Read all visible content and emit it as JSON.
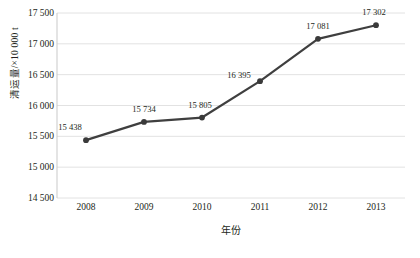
{
  "chart_data": {
    "type": "line",
    "title": "",
    "xlabel": "年份",
    "ylabel": "清运量/×10 000 t",
    "categories": [
      "2008",
      "2009",
      "2010",
      "2011",
      "2012",
      "2013"
    ],
    "values": [
      15438,
      15734,
      15805,
      16395,
      17081,
      17302
    ],
    "point_labels": [
      "15 438",
      "15 734",
      "15 805",
      "16 395",
      "17 081",
      "17 302"
    ],
    "ylim": [
      14500,
      17500
    ],
    "ytick_values": [
      14500,
      15000,
      15500,
      16000,
      16500,
      17000,
      17500
    ],
    "ytick_labels": [
      "14 500",
      "15 000",
      "15 500",
      "16 000",
      "16 500",
      "17 000",
      "17 500"
    ],
    "grid": "horizontal",
    "legend": "none",
    "series": [
      {
        "name": "清运量",
        "values": [
          15438,
          15734,
          15805,
          16395,
          17081,
          17302
        ]
      }
    ],
    "colors": {
      "line": "#3f3f3f",
      "marker": "#3a3a3a",
      "grid": "#e2e2e2",
      "axis": "#c9c9c9",
      "text": "#231f20"
    }
  },
  "caption": ""
}
